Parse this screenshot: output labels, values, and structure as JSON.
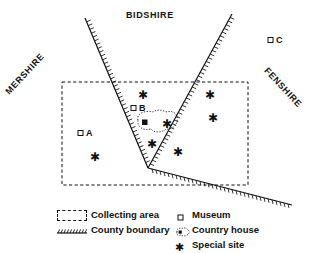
{
  "figure": {
    "name": "collecting-area-map",
    "width": 311,
    "height": 253,
    "background": "#ffffff",
    "ink": "#111111"
  },
  "counties": [
    {
      "id": "bidshire",
      "label": "BIDSHIRE",
      "rotation_deg": 0,
      "x": 126,
      "y": 10
    },
    {
      "id": "mershire",
      "label": "MERSHIRE",
      "rotation_deg": -47,
      "x": 7,
      "y": 88
    },
    {
      "id": "fenshire",
      "label": "FENSHIRE",
      "rotation_deg": 47,
      "x": 266,
      "y": 64
    }
  ],
  "collecting_area": {
    "label": "Collecting area",
    "style": "dashed-rectangle",
    "x": 62,
    "y": 82,
    "width": 186,
    "height": 103
  },
  "county_boundary": {
    "label": "County boundary",
    "style": "hatched-line",
    "vertices": [
      {
        "x": 85,
        "y": 18
      },
      {
        "x": 148,
        "y": 168
      },
      {
        "x": 232,
        "y": 14
      }
    ],
    "spur": [
      {
        "x": 148,
        "y": 168
      },
      {
        "x": 292,
        "y": 205
      }
    ]
  },
  "museums": {
    "label": "Museum",
    "symbol": "open-square",
    "items": [
      {
        "id": "A",
        "label": "A",
        "x": 80,
        "y": 133
      },
      {
        "id": "B",
        "label": "B",
        "x": 133,
        "y": 108
      },
      {
        "id": "C",
        "label": "C",
        "x": 270,
        "y": 40
      }
    ]
  },
  "country_house": {
    "label": "Country house",
    "symbol": "dotted-blob-with-filled-square",
    "x": 135,
    "y": 115,
    "width": 40,
    "height": 22,
    "filled_square": {
      "x": 142,
      "y": 122
    },
    "inner_star": {
      "x": 166,
      "y": 124
    }
  },
  "special_sites": {
    "label": "Special site",
    "symbol": "asterisk",
    "points": [
      {
        "x": 143,
        "y": 95
      },
      {
        "x": 210,
        "y": 95
      },
      {
        "x": 213,
        "y": 118
      },
      {
        "x": 166,
        "y": 124
      },
      {
        "x": 152,
        "y": 144
      },
      {
        "x": 178,
        "y": 152
      },
      {
        "x": 95,
        "y": 157
      }
    ]
  },
  "legend": {
    "name": "map-legend",
    "entries": [
      {
        "id": "collecting-area",
        "label": "Collecting area",
        "swatch": "dashed-rectangle-icon"
      },
      {
        "id": "county-boundary",
        "label": "County boundary",
        "swatch": "hatched-line-icon"
      },
      {
        "id": "museum",
        "label": "Museum",
        "swatch": "open-square-icon"
      },
      {
        "id": "country-house",
        "label": "Country house",
        "swatch": "blob-icon"
      },
      {
        "id": "special-site",
        "label": "Special site",
        "swatch": "asterisk-icon"
      }
    ]
  }
}
